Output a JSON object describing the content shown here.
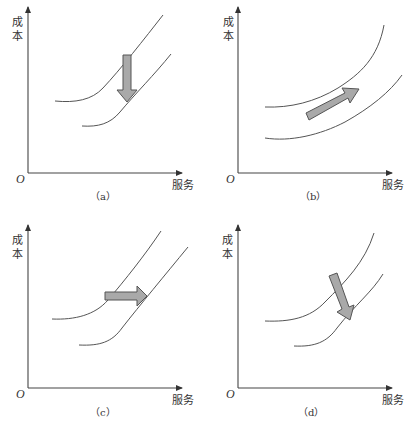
{
  "figure": {
    "panels": [
      {
        "id": "a",
        "caption": "（a）",
        "y_axis_label_line1": "成",
        "y_axis_label_line2": "本",
        "x_axis_label": "服务",
        "origin_label": "O",
        "arrow_direction": "down",
        "description": "Cost curve shifts downward"
      },
      {
        "id": "b",
        "caption": "（b）",
        "y_axis_label_line1": "成",
        "y_axis_label_line2": "本",
        "x_axis_label": "服务",
        "origin_label": "O",
        "arrow_direction": "up-right",
        "description": "Cost curve shifts up-right along the curve"
      },
      {
        "id": "c",
        "caption": "（c）",
        "y_axis_label_line1": "成",
        "y_axis_label_line2": "本",
        "x_axis_label": "服务",
        "origin_label": "O",
        "arrow_direction": "right",
        "description": "Cost curve shifts rightward"
      },
      {
        "id": "d",
        "caption": "（d）",
        "y_axis_label_line1": "成",
        "y_axis_label_line2": "本",
        "x_axis_label": "服务",
        "origin_label": "O",
        "arrow_direction": "down-right",
        "description": "Cost curve shifts down-right"
      }
    ],
    "colors": {
      "axis": "#444444",
      "curve": "#555555",
      "arrow_fill": "#a9a9a9",
      "background": "#ffffff"
    }
  }
}
